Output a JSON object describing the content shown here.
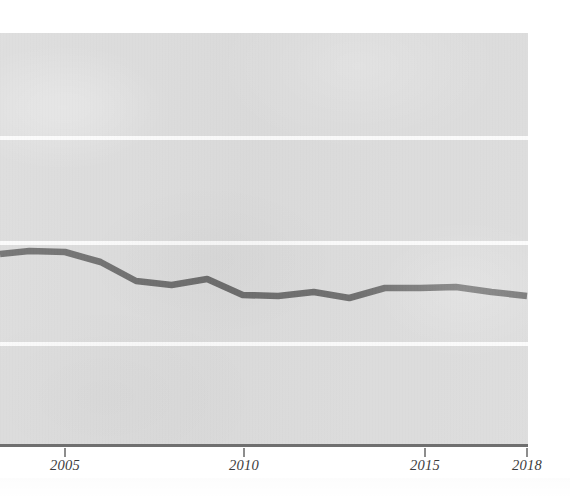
{
  "chart_data": {
    "type": "line",
    "title": "",
    "subtitle": "",
    "xlabel": "",
    "ylabel": "",
    "grid": true,
    "legend": null,
    "legend_position": "none",
    "xlim": [
      2003,
      2018
    ],
    "ylim": [
      0,
      5
    ],
    "xticks": [
      2005,
      2010,
      2015,
      2018
    ],
    "xtick_labels": [
      "2005",
      "2010",
      "2015",
      "2018"
    ],
    "yticks": [],
    "ytick_labels": [],
    "gridline_values": [
      1,
      2,
      3,
      4
    ],
    "series": [
      {
        "name": "series-1",
        "color": "#6e6e6e",
        "x": [
          2003,
          2004,
          2005,
          2006,
          2007,
          2008,
          2009,
          2010,
          2011,
          2012,
          2013,
          2014,
          2015,
          2016,
          2017,
          2018
        ],
        "y": [
          2.32,
          2.36,
          2.35,
          2.25,
          2.06,
          2.02,
          2.08,
          1.93,
          1.91,
          1.95,
          1.88,
          2.0,
          2.01,
          2.03,
          1.97,
          1.93
        ],
        "pixel_y": [
          254,
          251,
          252,
          262,
          281,
          285,
          279,
          295,
          296,
          292,
          298,
          288,
          288,
          287,
          292,
          296
        ]
      }
    ]
  },
  "axis": {
    "ticks": [
      {
        "label": "2005",
        "x_px": 65
      },
      {
        "label": "2010",
        "x_px": 244
      },
      {
        "label": "2015",
        "x_px": 425
      },
      {
        "label": "2018",
        "x_px": 527
      }
    ]
  },
  "style": {
    "panel_color": "#dcdcdc",
    "gridline_color": "#fbfbfb",
    "series_color": "#6e6e6e",
    "axis_color": "#6f6f6f",
    "tick_color": "#8d8d8d",
    "label_color": "#3c3c3c",
    "page_color": "#ffffff"
  },
  "gridlines_px": [
    136,
    241,
    342
  ]
}
